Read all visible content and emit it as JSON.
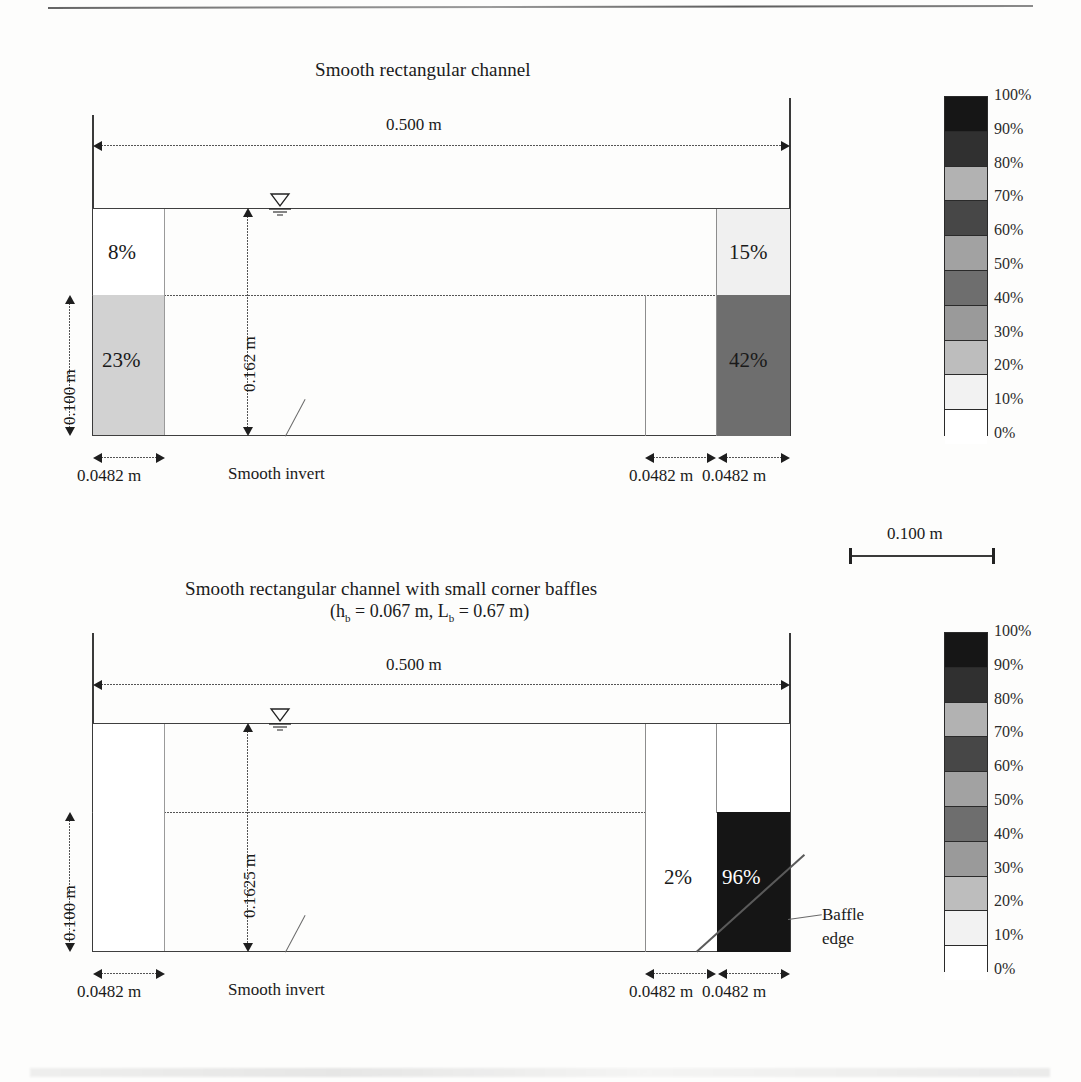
{
  "figure": {
    "kind": "two-panel channel cross-section with grayscale percentage map"
  },
  "panel_top": {
    "title": "Smooth rectangular channel",
    "width_label": "0.500 m",
    "depth_left_label": "0.100 m",
    "depth_center_label": "0.162 m",
    "cell_width_left_label": "0.0482 m",
    "cell_width_right_inner_label": "0.0482 m",
    "cell_width_right_outer_label": "0.0482 m",
    "invert_note": "Smooth invert",
    "cells": [
      {
        "id": "left-upper",
        "label": "8%",
        "value": 8,
        "fill": "#ffffff",
        "text_color": "dark"
      },
      {
        "id": "left-lower",
        "label": "23%",
        "value": 23,
        "fill": "#d2d2d2",
        "text_color": "dark"
      },
      {
        "id": "right-upper",
        "label": "15%",
        "value": 15,
        "fill": "#f0f0f0",
        "text_color": "dark"
      },
      {
        "id": "right-lower",
        "label": "42%",
        "value": 42,
        "fill": "#6e6e6e",
        "text_color": "dark"
      }
    ]
  },
  "panel_bottom": {
    "title": "Smooth rectangular channel with small corner baffles",
    "subtitle_prefix": "(h",
    "subtitle": "(hₑ = 0.067 m, Lₑ = 0.67 m)",
    "subtitle_parts": {
      "open": "(",
      "h_sym": "h",
      "h_sub": "b",
      "h_eq": " = 0.067 m, ",
      "l_sym": "L",
      "l_sub": "b",
      "l_eq": " = 0.67 m)"
    },
    "width_label": "0.500 m",
    "depth_left_label": "0.100 m",
    "depth_center_label": "0.1625 m",
    "cell_width_left_label": "0.0482 m",
    "cell_width_right_inner_label": "0.0482 m",
    "cell_width_right_outer_label": "0.0482 m",
    "invert_note": "Smooth invert",
    "baffle_note_line1": "Baffle",
    "baffle_note_line2": "edge",
    "cells": [
      {
        "id": "right-inner-lower",
        "label": "2%",
        "value": 2,
        "fill": "#ffffff",
        "text_color": "dark"
      },
      {
        "id": "right-outer-lower",
        "label": "96%",
        "value": 96,
        "fill": "#151515",
        "text_color": "light"
      }
    ]
  },
  "scale_bar": {
    "label": "0.100 m"
  },
  "colorbar": {
    "labels": [
      "100%",
      "90%",
      "80%",
      "70%",
      "60%",
      "50%",
      "40%",
      "30%",
      "20%",
      "10%",
      "0%"
    ],
    "bands_top_to_bottom": [
      {
        "range": "90-100%",
        "color": "#161616"
      },
      {
        "range": "80-90%",
        "color": "#303030"
      },
      {
        "range": "70-80%",
        "color": "#b2b2b2"
      },
      {
        "range": "60-70%",
        "color": "#474747"
      },
      {
        "range": "50-60%",
        "color": "#a2a2a2"
      },
      {
        "range": "40-50%",
        "color": "#6e6e6e"
      },
      {
        "range": "30-40%",
        "color": "#9a9a9a"
      },
      {
        "range": "20-30%",
        "color": "#bdbdbd"
      },
      {
        "range": "10-20%",
        "color": "#f2f2f2"
      },
      {
        "range": "0-10%",
        "color": "#ffffff"
      }
    ]
  },
  "symbols": {
    "water_surface": "free-surface-triangle"
  }
}
